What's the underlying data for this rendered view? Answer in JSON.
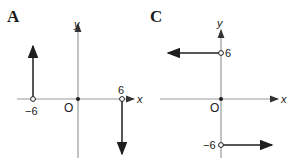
{
  "panels": [
    {
      "label": "A",
      "x_axis_label": "x",
      "y_axis_label": "y",
      "origin_label": "O",
      "ticks": {
        "neg": "−6",
        "pos": "6"
      },
      "description": "Vertical arrow up from open circle at x=-6; vertical arrow down from open circle at x=6"
    },
    {
      "label": "C",
      "x_axis_label": "x",
      "y_axis_label": "y",
      "origin_label": "O",
      "ticks": {
        "pos": "6",
        "neg": "−6"
      },
      "description": "Horizontal arrow left from open circle at y=6; horizontal arrow right from open circle at y=-6"
    }
  ],
  "colors": {
    "axis": "#9a9a9a",
    "arrow": "#1e1e1e",
    "text": "#222222"
  }
}
